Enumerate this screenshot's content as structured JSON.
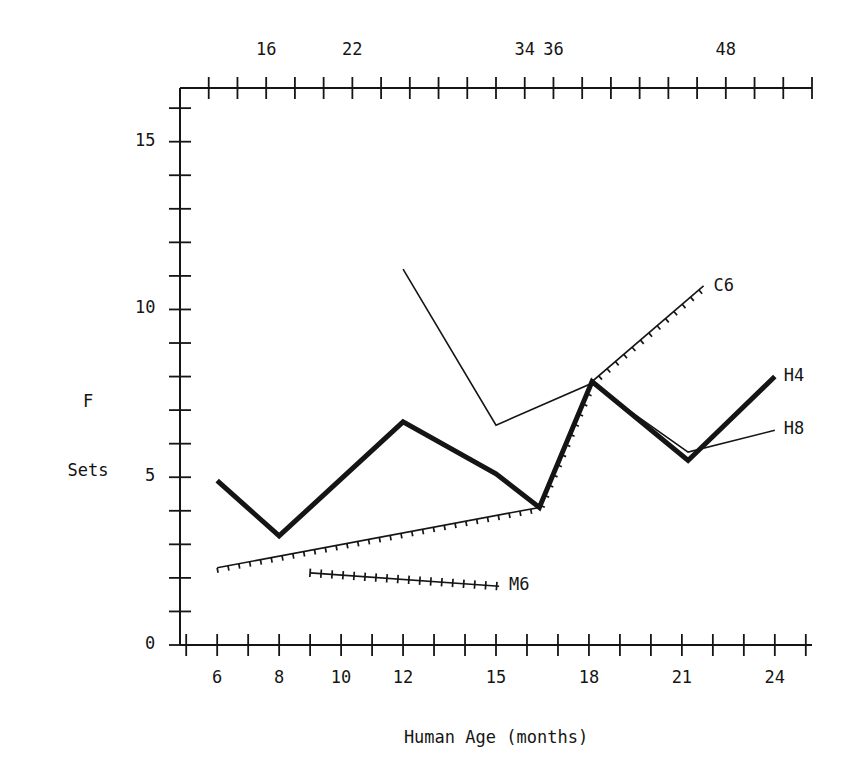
{
  "figure": {
    "width": 863,
    "height": 782,
    "background": "#ffffff",
    "ink_color": "#151515"
  },
  "axes": {
    "y_label_line1": "F",
    "y_label_line2": "Sets",
    "x_label_bottom": "Human Age (months)",
    "x_label_top": "",
    "y_ticks_labeled": [
      "0",
      "5",
      "10",
      "15"
    ],
    "y_tick_values": [
      0,
      5,
      10,
      15
    ],
    "y_range": [
      0,
      16.6
    ],
    "y_minor_step": 1,
    "x_bottom_ticks_labeled": [
      "6",
      "8",
      "10",
      "12",
      "15",
      "18",
      "21",
      "24"
    ],
    "x_bottom_tick_values": [
      6,
      8,
      10,
      12,
      15,
      18,
      21,
      24
    ],
    "x_range": [
      4.8,
      25.2
    ],
    "x_bottom_minor_step": 1,
    "x_top_ticks_labeled": [
      "16",
      "22",
      "34",
      "36",
      "48"
    ],
    "x_top_tick_values": [
      16,
      22,
      34,
      36,
      48
    ],
    "x_top_range": [
      10,
      54
    ],
    "x_top_minor_step": 2
  },
  "chart_data": {
    "type": "line",
    "title": "",
    "subtitle": "",
    "xlabel": "Human Age (months)",
    "ylabel": "F Sets",
    "xlim": [
      4.8,
      25.2
    ],
    "ylim": [
      0,
      16.6
    ],
    "grid": false,
    "legend_position": "right-inline-labels",
    "secondary_xaxis": {
      "label": "",
      "ticks": [
        16,
        22,
        34,
        36,
        48
      ],
      "range": [
        10,
        54
      ]
    },
    "series": [
      {
        "name": "H4",
        "label": "H4",
        "style": "thick-solid",
        "linewidth": 5,
        "marker": "none",
        "x": [
          6,
          8,
          12,
          15,
          16.4,
          18.1,
          21.2,
          24
        ],
        "y": [
          4.9,
          3.25,
          6.65,
          5.1,
          4.1,
          7.85,
          5.5,
          8.0
        ]
      },
      {
        "name": "H8",
        "label": "H8",
        "style": "thin-solid",
        "linewidth": 1.6,
        "marker": "none",
        "x": [
          12,
          15,
          18.1,
          19.2,
          21.2,
          24
        ],
        "y": [
          11.2,
          6.55,
          7.8,
          7.05,
          5.75,
          6.4
        ]
      },
      {
        "name": "C6",
        "label": "C6",
        "style": "tick-hatched-solid",
        "linewidth": 1.6,
        "marker": "short-tick",
        "x": [
          6,
          16.4,
          18.1,
          21.7
        ],
        "y": [
          2.3,
          4.1,
          7.85,
          10.7
        ]
      },
      {
        "name": "M6",
        "label": "M6",
        "style": "cross-hatched-solid",
        "linewidth": 1.6,
        "marker": "plus-tick",
        "x": [
          9,
          15.1
        ],
        "y": [
          2.15,
          1.75
        ]
      }
    ]
  },
  "series_labels": [
    {
      "name": "C6",
      "text": "C6"
    },
    {
      "name": "H4",
      "text": "H4"
    },
    {
      "name": "H8",
      "text": "H8"
    },
    {
      "name": "M6",
      "text": "M6"
    }
  ]
}
